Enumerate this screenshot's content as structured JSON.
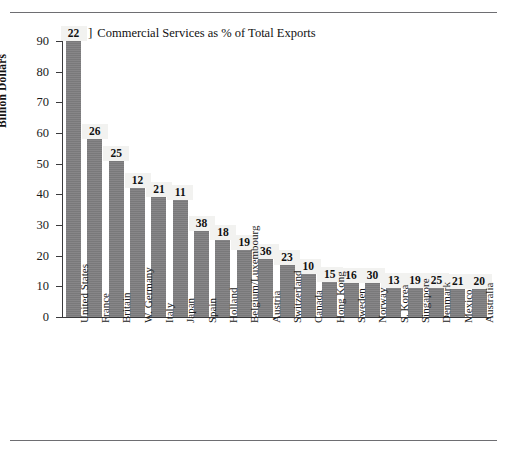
{
  "figure": {
    "legend_marker": "]",
    "legend_text": "Commercial Services as % of Total Exports"
  },
  "chart_data": {
    "type": "bar",
    "title": "",
    "subtitle": "",
    "xlabel": "",
    "ylabel": "Billion Dollars",
    "ylim": [
      0,
      90
    ],
    "ytick_step": 10,
    "yticks": [
      "90",
      "80",
      "70",
      "60",
      "50",
      "40",
      "30",
      "20",
      "10",
      "0"
    ],
    "grid": false,
    "legend": [
      "Commercial Services as % of Total Exports"
    ],
    "legend_position": "top-left",
    "bar_color": "#807f81",
    "value_label_note": "Number above each bar is Commercial Services as % of Total Exports",
    "categories": [
      "United States",
      "France",
      "Britain",
      "W. Germany",
      "Italy",
      "Japan",
      "Spain",
      "Holland",
      "Belgium/Luxembourg",
      "Austria",
      "Switzerland",
      "Canada",
      "Hong Kong",
      "Sweden",
      "Norway",
      "S. Korea",
      "Singapore",
      "Denmark",
      "Mexico",
      "Australia"
    ],
    "values": [
      90,
      58,
      51,
      42,
      39,
      38,
      28,
      25,
      22,
      19,
      17,
      14,
      11.5,
      11,
      11,
      9.5,
      9.5,
      9.5,
      9,
      9
    ],
    "percent_labels": [
      "22",
      "26",
      "25",
      "12",
      "21",
      "11",
      "38",
      "18",
      "19",
      "36",
      "23",
      "10",
      "15",
      "16",
      "30",
      "13",
      "19",
      "25",
      "21",
      "20"
    ]
  }
}
